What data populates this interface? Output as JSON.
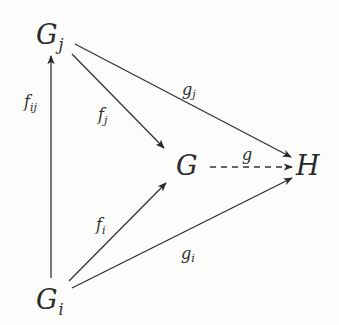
{
  "diagram": {
    "type": "commutative-diagram",
    "nodes": {
      "Gj": {
        "base": "G",
        "sub": "j"
      },
      "Gi": {
        "base": "G",
        "sub": "i"
      },
      "G": {
        "base": "G"
      },
      "H": {
        "base": "H"
      }
    },
    "edges": [
      {
        "from": "Gi",
        "to": "Gj",
        "label": {
          "base": "f",
          "sub": "ij"
        },
        "style": "solid"
      },
      {
        "from": "Gj",
        "to": "G",
        "label": {
          "base": "f",
          "sub": "j"
        },
        "style": "solid"
      },
      {
        "from": "Gj",
        "to": "H",
        "label": {
          "base": "g",
          "sub": "j"
        },
        "style": "solid"
      },
      {
        "from": "Gi",
        "to": "G",
        "label": {
          "base": "f",
          "sub": "i"
        },
        "style": "solid"
      },
      {
        "from": "Gi",
        "to": "H",
        "label": {
          "base": "g",
          "sub": "i"
        },
        "style": "solid"
      },
      {
        "from": "G",
        "to": "H",
        "label": {
          "base": "g"
        },
        "style": "dashed"
      }
    ],
    "colors": {
      "ink": "#2a2a2a",
      "background": "#fcfcfa"
    }
  }
}
